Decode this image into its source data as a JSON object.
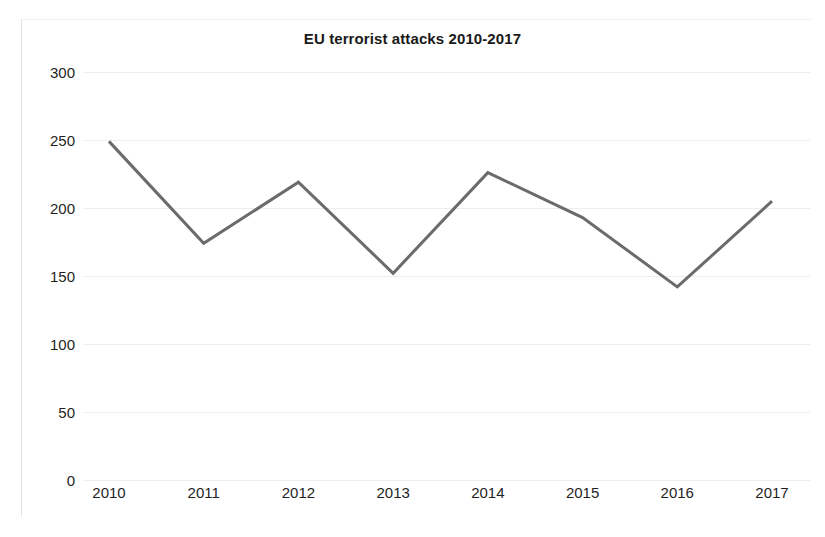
{
  "chart_data": {
    "type": "line",
    "title": "EU terrorist attacks 2010-2017",
    "xlabel": "",
    "ylabel": "",
    "categories": [
      "2010",
      "2011",
      "2012",
      "2013",
      "2014",
      "2015",
      "2016",
      "2017"
    ],
    "values": [
      249,
      174,
      219,
      152,
      226,
      193,
      142,
      205
    ],
    "series": [
      {
        "name": "EU terrorist attacks",
        "values": [
          249,
          174,
          219,
          152,
          226,
          193,
          142,
          205
        ]
      }
    ],
    "ylim": [
      0,
      300
    ],
    "yticks": [
      0,
      50,
      100,
      150,
      200,
      250,
      300
    ],
    "ytick_labels": [
      "0",
      "50",
      "100",
      "150",
      "200",
      "250",
      "300"
    ],
    "xtick_labels": [
      "2010",
      "2011",
      "2012",
      "2013",
      "2014",
      "2015",
      "2016",
      "2017"
    ],
    "grid": true,
    "grid_axis": "y",
    "legend": false,
    "legend_position": "none",
    "line_color": "#6b6b6b",
    "line_width": 3,
    "grid_color": "#ededed",
    "text_color": "#1f1f1f",
    "background": "#ffffff",
    "markers": false
  }
}
